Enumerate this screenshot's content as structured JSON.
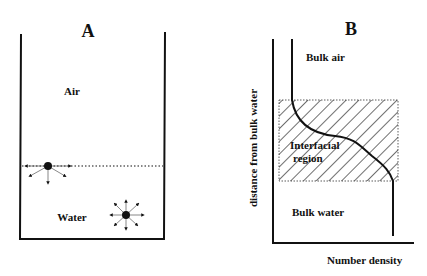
{
  "panel_a": {
    "title": "A",
    "air_label": "Air",
    "water_label": "Water",
    "icons": [
      "surface-molecule-icon",
      "bulk-molecule-icon"
    ]
  },
  "panel_b": {
    "title": "B",
    "bulk_air_label": "Bulk air",
    "interfacial_label_line1": "Interfacial",
    "interfacial_label_line2": "region",
    "bulk_water_label": "Bulk water",
    "y_axis_label": "distance from bulk water",
    "x_axis_label": "Number density"
  }
}
